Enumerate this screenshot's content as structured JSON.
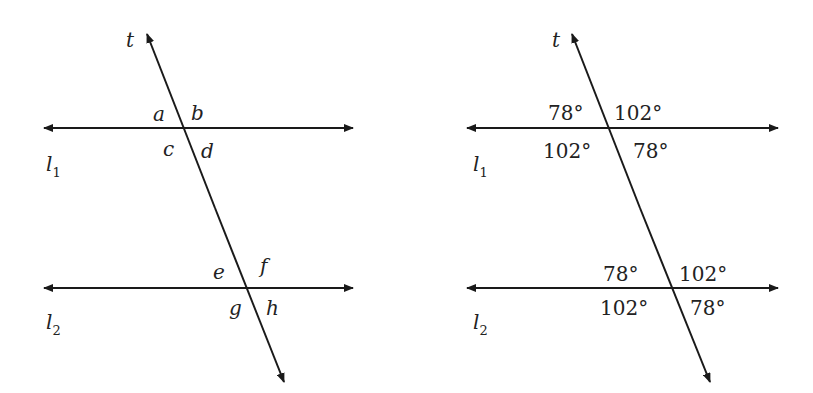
{
  "diagrams": [
    {
      "transversal": "t",
      "line1": {
        "name": "l",
        "sub": "1"
      },
      "line2": {
        "name": "l",
        "sub": "2"
      },
      "angles": {
        "top": [
          "a",
          "b",
          "c",
          "d"
        ],
        "bottom": [
          "e",
          "f",
          "g",
          "h"
        ]
      }
    },
    {
      "transversal": "t",
      "line1": {
        "name": "l",
        "sub": "1"
      },
      "line2": {
        "name": "l",
        "sub": "2"
      },
      "angles": {
        "top": [
          "78°",
          "102°",
          "102°",
          "78°"
        ],
        "bottom": [
          "78°",
          "102°",
          "102°",
          "78°"
        ]
      }
    }
  ],
  "colors": {
    "line": "#1a1a1a",
    "text": "#222222"
  }
}
